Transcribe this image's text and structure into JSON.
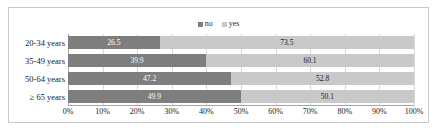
{
  "chart_data": {
    "type": "bar",
    "subtype": "stacked-horizontal-100pct",
    "title": "",
    "subtitle": "",
    "xlabel": "",
    "ylabel": "",
    "categories": [
      "20-34 years",
      "35-49 years",
      "50-64 years",
      "≥ 65 years"
    ],
    "series": [
      {
        "name": "no",
        "color": "#7e7e7e",
        "values": [
          26.5,
          39.9,
          47.2,
          49.9
        ]
      },
      {
        "name": "yes",
        "color": "#c9c9c9",
        "values": [
          73.5,
          60.1,
          52.8,
          50.1
        ]
      }
    ],
    "value_labels": {
      "no": [
        "26.5",
        "39.9",
        "47.2",
        "49.9"
      ],
      "yes": [
        "73.5",
        "60.1",
        "52.8",
        "50.1"
      ]
    },
    "xlim": [
      0,
      100
    ],
    "xticks": [
      0,
      10,
      20,
      30,
      40,
      50,
      60,
      70,
      80,
      90,
      100
    ],
    "xtick_labels": [
      "0%",
      "10%",
      "20%",
      "30%",
      "40%",
      "50%",
      "60%",
      "70%",
      "80%",
      "90%",
      "100%"
    ],
    "grid": true,
    "grid_axis": "x",
    "legend_position": "top-center",
    "legend": [
      {
        "label": "no",
        "color": "#7e7e7e"
      },
      {
        "label": "yes",
        "color": "#c9c9c9"
      }
    ]
  },
  "colors": {
    "series_no": "#7e7e7e",
    "series_yes": "#c9c9c9",
    "gridline": "#d9d9d9",
    "axis": "#a6a6a6",
    "frame_border": "#c8c8c8",
    "background": "#ffffff",
    "label_dark": "#1a1a1a",
    "label_light": "#ffffff"
  }
}
